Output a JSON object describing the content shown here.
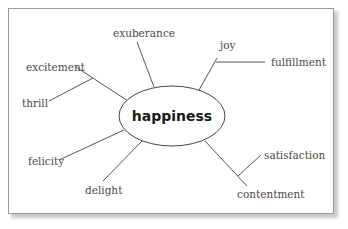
{
  "diagram": {
    "type": "mind-map",
    "center": {
      "label": "happiness"
    },
    "branches": [
      {
        "label": "exuberance"
      },
      {
        "label": "joy",
        "sub": {
          "label": "fulfillment"
        }
      },
      {
        "label": "excitement",
        "sub": {
          "label": "thrill"
        }
      },
      {
        "label": "felicity"
      },
      {
        "label": "delight"
      },
      {
        "label": "contentment",
        "sub": {
          "label": "satisfaction"
        }
      }
    ]
  },
  "colors": {
    "line": "#555555",
    "frame_border": "#9a9a9a",
    "label_text": "#4a4a4a",
    "center_text": "#1a1a1a"
  }
}
